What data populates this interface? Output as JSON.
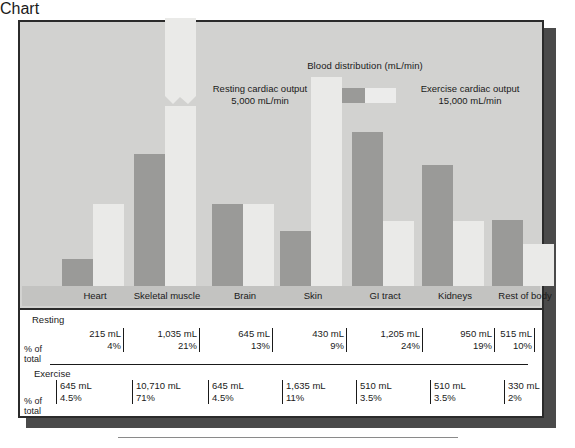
{
  "legend": {
    "title": "Blood distribution (mL/min)",
    "left_label": "Resting cardiac output",
    "left_value": "5,000 mL/min",
    "right_label": "Exercise cardiac output",
    "right_value": "15,000 mL/min",
    "resting_color": "#9a9a98",
    "exercise_color": "#eaeae8"
  },
  "table": {
    "resting_title": "Resting",
    "exercise_title": "Exercise",
    "pct_label_line1": "% of",
    "pct_label_line2": "total"
  },
  "chart_data": {
    "type": "bar",
    "title": "Blood distribution (mL/min)",
    "xlabel": "",
    "ylabel": "",
    "grid": false,
    "legend_position": "top",
    "note": "Skeletal muscle exercise bar is drawn with an axis-break mark because its value greatly exceeds the plot scale.",
    "categories": [
      "Heart",
      "Skeletal muscle",
      "Brain",
      "Skin",
      "GI tract",
      "Kidneys",
      "Rest of body"
    ],
    "series": [
      {
        "name": "Resting cardiac output",
        "total": "5,000 mL/min",
        "color": "#9a9a98",
        "values": [
          215,
          1035,
          645,
          430,
          1205,
          950,
          515
        ],
        "value_labels": [
          "215 mL",
          "1,035 mL",
          "645 mL",
          "430 mL",
          "1,205 mL",
          "950 mL",
          "515 mL"
        ],
        "percents": [
          4,
          21,
          13,
          9,
          24,
          19,
          10
        ],
        "percent_labels": [
          "4%",
          "21%",
          "13%",
          "9%",
          "24%",
          "19%",
          "10%"
        ]
      },
      {
        "name": "Exercise cardiac output",
        "total": "15,000 mL/min",
        "color": "#eaeae8",
        "values": [
          645,
          10710,
          645,
          1635,
          510,
          510,
          330
        ],
        "value_labels": [
          "645 mL",
          "10,710 mL",
          "645 mL",
          "1,635 mL",
          "510 mL",
          "510 mL",
          "330 mL"
        ],
        "percents": [
          4.5,
          71,
          4.5,
          11,
          3.5,
          3.5,
          2
        ],
        "percent_labels": [
          "4.5%",
          "71%",
          "4.5%",
          "11%",
          "3.5%",
          "3.5%",
          "2%"
        ]
      }
    ]
  }
}
